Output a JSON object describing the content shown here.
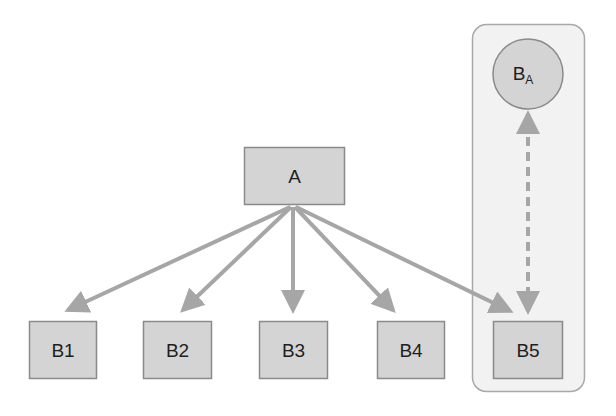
{
  "diagram": {
    "type": "tree-with-association",
    "colors": {
      "box_fill": "#d4d4d4",
      "box_stroke": "#8a8a8a",
      "arrow": "#a6a6a6",
      "container_fill": "#f2f2f2",
      "container_stroke": "#a8a8a8",
      "text": "#1e1e1e"
    },
    "root": {
      "id": "A",
      "label": "A"
    },
    "children": [
      {
        "id": "B1",
        "label": "B1"
      },
      {
        "id": "B2",
        "label": "B2"
      },
      {
        "id": "B3",
        "label": "B3"
      },
      {
        "id": "B4",
        "label": "B4"
      },
      {
        "id": "B5",
        "label": "B5"
      }
    ],
    "associated": {
      "id": "BA",
      "label_main": "B",
      "label_sub": "A"
    },
    "edges": [
      {
        "from": "A",
        "to": "B1",
        "style": "solid"
      },
      {
        "from": "A",
        "to": "B2",
        "style": "solid"
      },
      {
        "from": "A",
        "to": "B3",
        "style": "solid"
      },
      {
        "from": "A",
        "to": "B4",
        "style": "solid"
      },
      {
        "from": "A",
        "to": "B5",
        "style": "solid"
      },
      {
        "from": "B5",
        "to": "BA",
        "style": "dashed",
        "bidirectional": true
      }
    ],
    "group": {
      "members": [
        "B5",
        "BA"
      ]
    }
  }
}
